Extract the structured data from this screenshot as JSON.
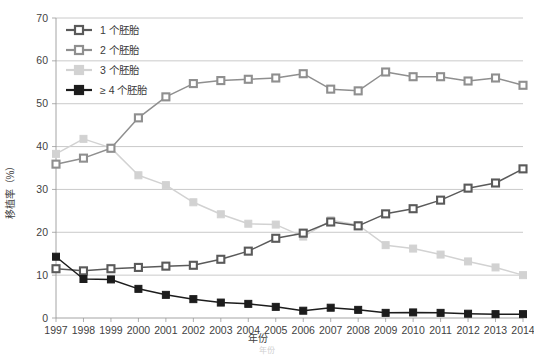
{
  "chart_data": {
    "type": "line",
    "title": "",
    "xlabel": "年份",
    "ylabel": "移植率（%）",
    "categories": [
      "1997",
      "1998",
      "1999",
      "2000",
      "2001",
      "2002",
      "2003",
      "2004",
      "2005",
      "2006",
      "2007",
      "2008",
      "2009",
      "2010",
      "2011",
      "2012",
      "2013",
      "2014"
    ],
    "x": [
      1997,
      1998,
      1999,
      2000,
      2001,
      2002,
      2003,
      2004,
      2005,
      2006,
      2007,
      2008,
      2009,
      2010,
      2011,
      2012,
      2013,
      2014
    ],
    "xlim": [
      1997,
      2014
    ],
    "ylim": [
      0,
      70
    ],
    "yticks": [
      "0",
      "10",
      "20",
      "30",
      "40",
      "50",
      "60",
      "70"
    ],
    "grid": true,
    "legend_position": "top-left",
    "series": [
      {
        "name": "1 个胚胎",
        "color": "#5a5a5a",
        "marker": "open-square",
        "values": [
          11.5,
          11.0,
          11.5,
          11.8,
          12.1,
          12.3,
          13.7,
          15.6,
          18.6,
          19.8,
          22.4,
          21.5,
          24.3,
          25.5,
          27.5,
          30.3,
          31.5,
          34.8
        ]
      },
      {
        "name": "2 个胚胎",
        "color": "#8f8f8f",
        "marker": "open-square",
        "values": [
          35.9,
          37.3,
          39.6,
          46.7,
          51.6,
          54.7,
          55.4,
          55.7,
          56.0,
          57.0,
          53.4,
          53.0,
          57.4,
          56.3,
          56.3,
          55.3,
          56.0,
          54.3
        ]
      },
      {
        "name": "3 个胚胎",
        "color": "#d2d2d2",
        "marker": "filled-square",
        "values": [
          38.3,
          41.8,
          39.7,
          33.3,
          31.0,
          27.0,
          24.2,
          22.0,
          21.8,
          19.0,
          22.8,
          21.7,
          17.0,
          16.2,
          14.8,
          13.2,
          11.8,
          10.0
        ]
      },
      {
        "name": "≥ 4 个胚胎",
        "color": "#1c1c1c",
        "marker": "filled-square",
        "values": [
          14.3,
          9.1,
          9.0,
          6.8,
          5.4,
          4.4,
          3.6,
          3.3,
          2.6,
          1.7,
          2.4,
          1.9,
          1.2,
          1.3,
          1.2,
          1.0,
          0.9,
          0.9
        ]
      }
    ],
    "caption_partial": "年份"
  },
  "legend": {
    "items": [
      {
        "label": "1 个胚胎"
      },
      {
        "label": "2 个胚胎"
      },
      {
        "label": "3 个胚胎"
      },
      {
        "label": "≥ 4 个胚胎"
      }
    ]
  },
  "colors": {
    "series1": "#5a5a5a",
    "series2": "#8f8f8f",
    "series3": "#d2d2d2",
    "series4": "#1c1c1c",
    "grid": "#bcbcbc",
    "axis": "#9a9a9a",
    "text": "#3a3a3a",
    "background": "#ffffff"
  }
}
